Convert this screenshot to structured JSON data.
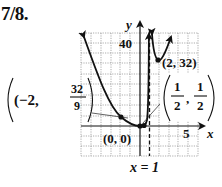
{
  "figure": {
    "problem_number": "7/8.",
    "axes": {
      "x_label": "x",
      "y_label": "y",
      "x_tick_label": "5",
      "y_tick_label": "40"
    },
    "asymptote": {
      "label": "x = 1",
      "style": "dashed",
      "x": 1
    },
    "points": [
      {
        "label_prefix": "(−2, ",
        "label_num": "32",
        "label_den": "9",
        "label_suffix": ")",
        "x": -2,
        "y": 3.556
      },
      {
        "label": "(0, 0)",
        "x": 0,
        "y": 0
      },
      {
        "label_open": "(",
        "label_num1": "1",
        "label_den1": "2",
        "label_sep": ",",
        "label_num2": "1",
        "label_den2": "2",
        "label_close": ")",
        "x": 0.5,
        "y": 0.5
      },
      {
        "label": "(2, 32)",
        "x": 2,
        "y": 32
      }
    ],
    "colors": {
      "curve": "#111111",
      "grid": "#8a8a8a",
      "axis": "#111111",
      "background": "#ffffff"
    }
  }
}
